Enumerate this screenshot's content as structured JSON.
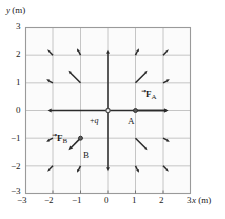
{
  "chart_data": {
    "type": "scatter",
    "title": "",
    "xlabel": "x (m)",
    "ylabel": "y (m)",
    "xlim": [
      -3,
      3
    ],
    "ylim": [
      -3,
      3
    ],
    "grid": true,
    "legend": "none",
    "x_ticks": [
      "-3",
      "-2",
      "-1",
      "0",
      "1",
      "2",
      "3"
    ],
    "y_ticks": [
      "3",
      "2",
      "1",
      "0",
      "-1",
      "-2",
      "-3"
    ],
    "x_tick_values": [
      -3,
      -2,
      -1,
      0,
      1,
      2,
      3
    ],
    "y_tick_values": [
      3,
      2,
      1,
      0,
      -1,
      -2,
      -3
    ],
    "charge": {
      "label": "+q",
      "x": 0,
      "y": 0
    },
    "points": [
      {
        "name": "A",
        "label": "A",
        "x": 1,
        "y": 0
      },
      {
        "name": "B",
        "label": "B",
        "x": -1,
        "y": -1
      }
    ],
    "force_vectors": [
      {
        "name": "F_A",
        "label": "F",
        "sub": "A",
        "at_x": 1,
        "at_y": 0,
        "dir_deg": 0,
        "length_m": 1.2
      },
      {
        "name": "F_B",
        "label": "F",
        "sub": "B",
        "at_x": -1,
        "at_y": -1,
        "dir_deg": 225,
        "length_m": 0.62
      }
    ],
    "field_arrows": [
      {
        "x": 0,
        "y": 0,
        "angle_deg": 0,
        "len": 2.2
      },
      {
        "x": 0,
        "y": 0,
        "angle_deg": 180,
        "len": 2.2
      },
      {
        "x": 0,
        "y": 0,
        "angle_deg": 90,
        "len": 2.2
      },
      {
        "x": 0,
        "y": 0,
        "angle_deg": 270,
        "len": 2.2
      },
      {
        "x": 1,
        "y": 1,
        "angle_deg": 45,
        "len": 0.62
      },
      {
        "x": 2,
        "y": 2,
        "angle_deg": 45,
        "len": 0.3
      },
      {
        "x": -1,
        "y": 1,
        "angle_deg": 135,
        "len": 0.62
      },
      {
        "x": -2,
        "y": 2,
        "angle_deg": 135,
        "len": 0.3
      },
      {
        "x": -2,
        "y": -2,
        "angle_deg": 225,
        "len": 0.3
      },
      {
        "x": 1,
        "y": -1,
        "angle_deg": 315,
        "len": 0.62
      },
      {
        "x": 2,
        "y": -2,
        "angle_deg": 315,
        "len": 0.3
      },
      {
        "x": 1,
        "y": 2,
        "angle_deg": 63,
        "len": 0.28
      },
      {
        "x": 2,
        "y": 1,
        "angle_deg": 27,
        "len": 0.28
      },
      {
        "x": -1,
        "y": 2,
        "angle_deg": 117,
        "len": 0.28
      },
      {
        "x": -2,
        "y": 1,
        "angle_deg": 153,
        "len": 0.28
      },
      {
        "x": -1,
        "y": -2,
        "angle_deg": 243,
        "len": 0.28
      },
      {
        "x": -2,
        "y": -1,
        "angle_deg": 207,
        "len": 0.28
      },
      {
        "x": 1,
        "y": -2,
        "angle_deg": 297,
        "len": 0.28
      },
      {
        "x": 2,
        "y": -1,
        "angle_deg": 333,
        "len": 0.28
      }
    ],
    "colors": {
      "plot_background": "#fbfbfb",
      "grid": "#b8b8b8",
      "border": "#9a9a9a",
      "arrow": "#2b2b2b",
      "text": "#1a1a1a"
    }
  },
  "axes": {
    "x_axis_label_italic": "x",
    "x_axis_label_unit": " (m)",
    "y_axis_label_italic": "y",
    "y_axis_label_unit": " (m)"
  },
  "labels": {
    "charge": "+q",
    "charge_sign": "+",
    "charge_symbol": "q",
    "point_a": "A",
    "point_b": "B",
    "force_a_bold": "F",
    "force_a_sub": "A",
    "force_b_bold": "F",
    "force_b_sub": "B",
    "x_tick_m3": "−3",
    "x_tick_m2": "−2",
    "x_tick_m1": "−1",
    "x_tick_0": "0",
    "x_tick_1": "1",
    "x_tick_2": "2",
    "x_tick_3": "3",
    "y_tick_3": "3",
    "y_tick_2": "2",
    "y_tick_1": "1",
    "y_tick_0": "0",
    "y_tick_m1": "−1",
    "y_tick_m2": "−2",
    "y_tick_m3": "−3"
  }
}
